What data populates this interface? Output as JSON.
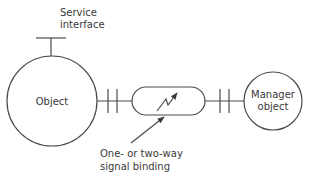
{
  "diagram": {
    "service_interface_label": [
      "Service",
      "interface"
    ],
    "object_label": "Object",
    "manager_label": [
      "Manager",
      "object"
    ],
    "binding_caption": [
      "One- or two-way",
      "signal binding"
    ],
    "binding_icon": "lightning-arrow-icon",
    "colors": {
      "line": "#4a4a4a",
      "text": "#3a3a3a",
      "background": "#ffffff"
    }
  }
}
